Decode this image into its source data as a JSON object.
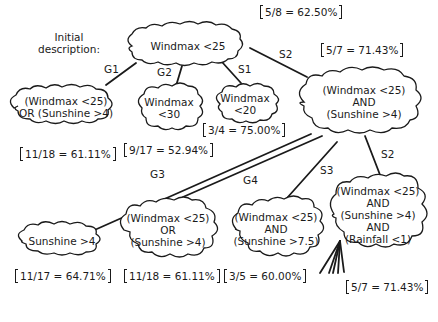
{
  "intro": {
    "line1": "Initial",
    "line2": "description:"
  },
  "nodes": {
    "root": {
      "lines": [
        "Windmax <25"
      ],
      "score": "5/8 = 62.50%"
    },
    "g1": {
      "lines": [
        "(Windmax <25)",
        "OR (Sunshine >4)"
      ],
      "score": "11/18 = 61.11%"
    },
    "g2": {
      "lines": [
        "Windmax",
        "<30"
      ],
      "score": "9/17 = 52.94%"
    },
    "s1": {
      "lines": [
        "Windmax",
        "<20"
      ],
      "score": "3/4 = 75.00%"
    },
    "s2": {
      "lines": [
        "(Windmax <25)",
        "AND",
        "(Sunshine >4)"
      ],
      "score": "5/7 = 71.43%"
    },
    "g3": {
      "lines": [
        "Sunshine >4"
      ],
      "score": "11/17 = 64.71%"
    },
    "g4": {
      "lines": [
        "(Windmax <25)",
        "OR",
        "(Sunshine >4)"
      ],
      "score": "11/18 = 61.11%"
    },
    "s3": {
      "lines": [
        "(Windmax <25)",
        "AND",
        "(Sunshine >7.5)"
      ],
      "score": "3/5 = 60.00%"
    },
    "s2b": {
      "lines": [
        "(Windmax <25)",
        "AND",
        "(Sunshine >4)",
        "AND",
        "(Rainfall <1)"
      ],
      "score": "5/7 = 71.43%"
    }
  },
  "edge_labels": {
    "g1": "G1",
    "g2": "G2",
    "s1": "S1",
    "s2": "S2",
    "g3": "G3",
    "g4": "G4",
    "s3": "S3",
    "s2b": "S2"
  },
  "colors": {
    "ink": "#1a1a1a",
    "background": "#ffffff"
  }
}
